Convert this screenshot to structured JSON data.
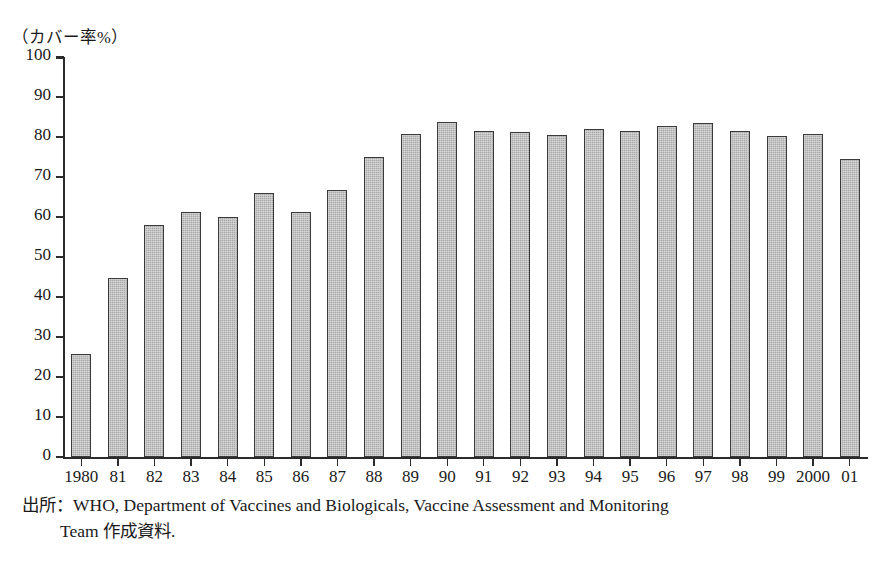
{
  "figure": {
    "y_unit_caption": "（カバー率%）",
    "source_note_line1": "出所：WHO, Department of Vaccines and Biologicals, Vaccine Assessment and Monitoring",
    "source_note_line2": "Team 作成資料."
  },
  "chart_data": {
    "type": "bar",
    "title": "",
    "subtitle": "",
    "xlabel": "",
    "ylabel": "（カバー率%）",
    "ylim": [
      0,
      100
    ],
    "y_ticks": [
      0,
      10,
      20,
      30,
      40,
      50,
      60,
      70,
      80,
      90,
      100
    ],
    "y_tick_labels": [
      "0",
      "10",
      "20",
      "30",
      "40",
      "50",
      "60",
      "70",
      "80",
      "90",
      "100"
    ],
    "grid": false,
    "legend": null,
    "legend_position": "none",
    "bar_fill_color": "#a9a9a9",
    "bar_edge_color": "#3a3a3a",
    "categories": [
      "1980",
      "81",
      "82",
      "83",
      "84",
      "85",
      "86",
      "87",
      "88",
      "89",
      "90",
      "91",
      "92",
      "93",
      "94",
      "95",
      "96",
      "97",
      "98",
      "99",
      "2000",
      "01"
    ],
    "values": [
      25.8,
      44.8,
      58.0,
      61.3,
      60.0,
      66.0,
      61.3,
      66.8,
      75.0,
      80.8,
      83.8,
      81.5,
      81.3,
      80.5,
      82.0,
      81.4,
      82.8,
      83.4,
      81.5,
      80.3,
      80.8,
      74.5
    ]
  }
}
